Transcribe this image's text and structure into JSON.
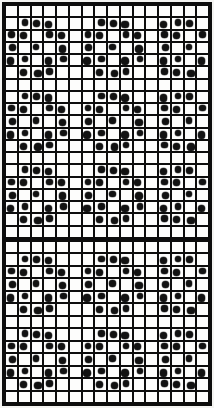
{
  "pattern_chart": {
    "description": "black-and-white dot pattern grid chart, two sections divided by a thick horizontal bar",
    "columns": 16,
    "sections": [
      {
        "name": "top-section",
        "row_count": 19,
        "rows": [
          "E",
          "A",
          "B",
          "C",
          "B",
          "A",
          "E",
          "A",
          "B",
          "C",
          "B",
          "A",
          "E",
          "A",
          "B",
          "C",
          "B",
          "A",
          "E"
        ]
      },
      {
        "name": "bottom-section",
        "row_count": 13,
        "rows": [
          "E",
          "A",
          "B",
          "C",
          "B",
          "A",
          "E",
          "A",
          "B",
          "C",
          "B",
          "A",
          "E"
        ]
      }
    ],
    "row_types": {
      "E": [],
      "A": [
        2,
        3,
        4,
        8,
        9,
        10,
        13,
        14,
        15
      ],
      "B": [
        1,
        2,
        4,
        5,
        7,
        8,
        10,
        11,
        13,
        14,
        16
      ],
      "C": [
        1,
        3,
        5,
        7,
        9,
        11,
        13,
        15
      ]
    },
    "motif": {
      "repeat_rows": 6,
      "shape": "diamond flower of dots: 3-dot row, pair row, alternating-single row, pair row, 3-dot row, empty spacer row"
    },
    "colors": {
      "background": "#f4f4f2",
      "grid_lines": "#0d0d0d",
      "cell_fill": "#fdfdfc",
      "dot_fill": "#121212",
      "outer_border": "#0d0d0d",
      "section_divider": "#0d0d0d"
    }
  }
}
